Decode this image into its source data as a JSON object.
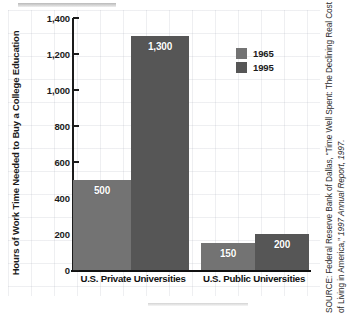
{
  "chart_data": {
    "type": "bar",
    "title": "",
    "subtitle": "",
    "xlabel": "",
    "ylabel": "Hours of Work Time Needed to Buy a College Education",
    "categories": [
      "U.S. Private Universities",
      "U.S. Public Universities"
    ],
    "series": [
      {
        "name": "1965",
        "color": "#737373",
        "values": [
          500,
          150
        ],
        "labels": [
          "500",
          "150"
        ]
      },
      {
        "name": "1995",
        "color": "#565656",
        "values": [
          1300,
          200
        ],
        "labels": [
          "1,300",
          "200"
        ]
      }
    ],
    "ylim": [
      0,
      1400
    ],
    "y_ticks": [
      0,
      200,
      400,
      600,
      800,
      1000,
      1200,
      1400
    ],
    "y_tick_labels": [
      "0",
      "200",
      "400",
      "600",
      "800",
      "1,000",
      "1,200",
      "1,400"
    ],
    "grid": true,
    "grid_color": "#d8dae2",
    "legend_position": "upper-right",
    "axis_color": "#1b1b1b",
    "background_color": "#ffffff"
  },
  "legend": {
    "entries": [
      {
        "label": "1965",
        "color": "#737373"
      },
      {
        "label": "1995",
        "color": "#565656"
      }
    ]
  },
  "source": {
    "prefix": "SOURCE: Federal Reserve Bank of Dallas, “Time Well Spent: The Declining Real Cost of Living in America,” ",
    "italic": "1997 Annual Report",
    "suffix": ", 1997."
  }
}
